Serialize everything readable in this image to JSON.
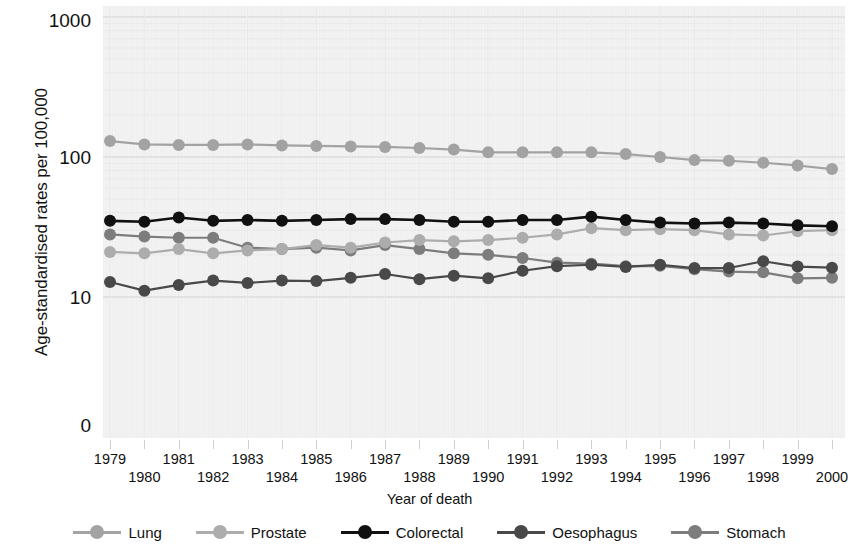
{
  "chart_data": {
    "type": "line",
    "title": "",
    "xlabel": "Year of death",
    "ylabel": "Age-standardised rates per 100,000",
    "yscale": "log",
    "ytick_labels": [
      "1000",
      "100",
      "10",
      "0"
    ],
    "ytick_values": [
      1000,
      100,
      10,
      0
    ],
    "grid": true,
    "legend_position": "bottom",
    "categories": [
      "1979",
      "1980",
      "1981",
      "1982",
      "1983",
      "1984",
      "1985",
      "1986",
      "1987",
      "1988",
      "1989",
      "1990",
      "1991",
      "1992",
      "1993",
      "1994",
      "1995",
      "1996",
      "1997",
      "1998",
      "1999",
      "2000"
    ],
    "series": [
      {
        "name": "Lung",
        "color": "#a3a3a3",
        "values": [
          130,
          123,
          122,
          122,
          123,
          121,
          120,
          119,
          118,
          116,
          113,
          108,
          108,
          108,
          108,
          105,
          100,
          95,
          94,
          91,
          87,
          82
        ]
      },
      {
        "name": "Prostate",
        "color": "#adadad",
        "values": [
          21,
          20.5,
          22,
          20.5,
          21.5,
          22,
          23.5,
          22.5,
          24.5,
          25.5,
          25,
          25.5,
          26.5,
          28,
          31,
          30,
          30.5,
          30,
          28,
          27.5,
          29.5,
          30
        ]
      },
      {
        "name": "Colorectal",
        "color": "#111111",
        "values": [
          35,
          34.5,
          37,
          35,
          35.5,
          35,
          35.5,
          36,
          36,
          35.5,
          34.5,
          34.5,
          35.5,
          35.5,
          37.5,
          35.5,
          34,
          33.5,
          34,
          33.5,
          32.5,
          32
        ]
      },
      {
        "name": "Oesophagus",
        "color": "#494949",
        "values": [
          12.8,
          11.1,
          12.2,
          13.1,
          12.6,
          13.1,
          13,
          13.7,
          14.6,
          13.4,
          14.2,
          13.6,
          15.4,
          16.6,
          17,
          16.4,
          17,
          16.1,
          16.1,
          18,
          16.5,
          16.2
        ]
      },
      {
        "name": "Stomach",
        "color": "#7d7d7d",
        "values": [
          28,
          27,
          26.5,
          26.5,
          22.5,
          22,
          22.5,
          21.5,
          23.5,
          22,
          20.5,
          20,
          19,
          17.6,
          17.3,
          16.6,
          16.7,
          15.8,
          15.2,
          15,
          13.6,
          13.7
        ]
      }
    ]
  },
  "legend": {
    "items": [
      {
        "label": "Lung"
      },
      {
        "label": "Prostate"
      },
      {
        "label": "Colorectal"
      },
      {
        "label": "Oesophagus"
      },
      {
        "label": "Stomach"
      }
    ]
  },
  "axes": {
    "y_title": "Age-standardised rates per 100,000",
    "x_title": "Year of death"
  },
  "colors": {
    "plot_background": "#f2f2f2",
    "gridline": "#d4d4d4",
    "text": "#111111"
  }
}
